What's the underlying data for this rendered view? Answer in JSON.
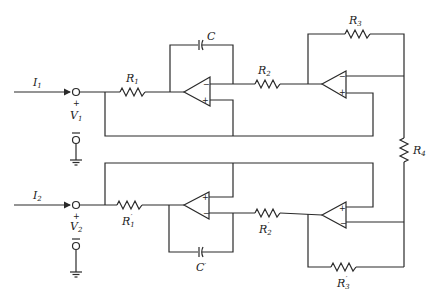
{
  "diagram": {
    "type": "circuit-schematic",
    "colors": {
      "line": "#2a2a2a",
      "background": "#ffffff"
    },
    "ports": [
      {
        "current": "I",
        "current_sub": "1",
        "voltage": "V",
        "voltage_sub": "1",
        "plus": "+",
        "minus": "—"
      },
      {
        "current": "I",
        "current_sub": "2",
        "voltage": "V",
        "voltage_sub": "2",
        "plus": "+",
        "minus": "—"
      }
    ],
    "components": {
      "R1": {
        "name": "R",
        "sub": "1"
      },
      "R2": {
        "name": "R",
        "sub": "2"
      },
      "R3": {
        "name": "R",
        "sub": "3"
      },
      "R4": {
        "name": "R",
        "sub": "4"
      },
      "C": {
        "name": "C"
      },
      "R1p": {
        "name": "R",
        "sub": "1",
        "prime": "′"
      },
      "R2p": {
        "name": "R",
        "sub": "2",
        "prime": "′"
      },
      "R3p": {
        "name": "R",
        "sub": "3",
        "prime": "′"
      },
      "Cp": {
        "name": "C",
        "prime": "′"
      }
    },
    "opamps": [
      {
        "id": "A1",
        "top_input": "−",
        "bottom_input": "+"
      },
      {
        "id": "A2",
        "top_input": "−",
        "bottom_input": "+"
      },
      {
        "id": "A3",
        "top_input": "+",
        "bottom_input": "−"
      },
      {
        "id": "A4",
        "top_input": "+",
        "bottom_input": "−"
      }
    ]
  }
}
